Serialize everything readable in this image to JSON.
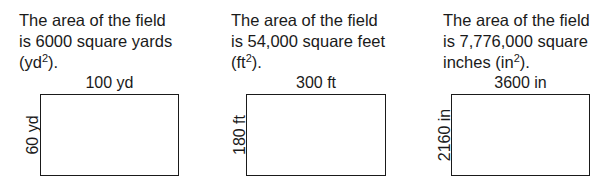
{
  "panels": [
    {
      "caption_line1": "The area of the field",
      "caption_line2": "is 6000 square yards",
      "caption_line3_pre": "(yd",
      "caption_line3_sup": "2",
      "caption_line3_post": ").",
      "width_label": "100 yd",
      "height_label": "60 yd"
    },
    {
      "caption_line1": "The area of the field",
      "caption_line2": "is 54,000 square feet",
      "caption_line3_pre": "(ft",
      "caption_line3_sup": "2",
      "caption_line3_post": ").",
      "width_label": "300 ft",
      "height_label": "180 ft"
    },
    {
      "caption_line1": "The area of the field",
      "caption_line2": "is 7,776,000 square",
      "caption_line3_pre": "inches (in",
      "caption_line3_sup": "2",
      "caption_line3_post": ").",
      "width_label": "3600 in",
      "height_label": "2160 in"
    }
  ]
}
